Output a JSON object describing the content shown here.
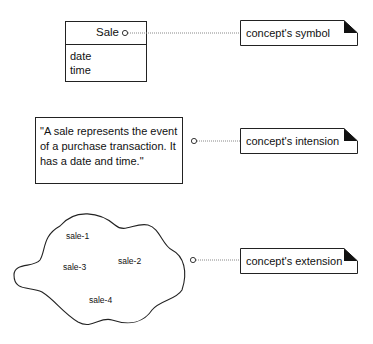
{
  "symbol_class": {
    "name": "Sale",
    "attributes": [
      "date",
      "time"
    ]
  },
  "intension_text": {
    "lines": [
      "\"A sale represents the event",
      "of a purchase transaction. It",
      "has a date and time.\""
    ]
  },
  "extension_set": {
    "members": [
      "sale-1",
      "sale-2",
      "sale-3",
      "sale-4"
    ]
  },
  "notes": [
    {
      "label": "concept's symbol"
    },
    {
      "label": "concept's intension"
    },
    {
      "label": "concept's extension"
    }
  ],
  "colors": {
    "stroke": "#222222",
    "background": "#ffffff",
    "connector": "#888888"
  }
}
